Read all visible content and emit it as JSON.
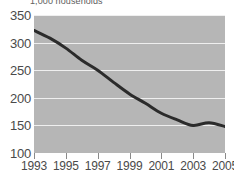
{
  "chart_data": {
    "type": "line",
    "title": "1,000 households",
    "xlabel": "",
    "ylabel": "",
    "x": [
      1993,
      1994,
      1995,
      1996,
      1997,
      1998,
      1999,
      2000,
      2001,
      2002,
      2003,
      2004,
      2005
    ],
    "values": [
      322,
      308,
      290,
      268,
      250,
      228,
      207,
      190,
      172,
      160,
      150,
      155,
      148
    ],
    "series": [
      {
        "name": "households",
        "values": [
          322,
          308,
          290,
          268,
          250,
          228,
          207,
          190,
          172,
          160,
          150,
          155,
          148
        ]
      }
    ],
    "ylim": [
      100,
      350
    ],
    "xlim": [
      1993,
      2005
    ],
    "yticks": [
      100,
      150,
      200,
      250,
      300,
      350
    ],
    "ytick_labels": [
      "100",
      "150",
      "200",
      "250",
      "300",
      "350"
    ],
    "xticks": [
      1993,
      1995,
      1997,
      1999,
      2001,
      2003,
      2005
    ],
    "xtick_labels": [
      "1993",
      "1995",
      "1997",
      "1999",
      "2001",
      "2003",
      "2005"
    ],
    "grid": true,
    "legend": false,
    "legend_position": "none",
    "colors": {
      "plot_background": "#b6b6b6",
      "gridline": "#efefef",
      "line": "#2b2b2b",
      "axis_text": "#4a4a4a",
      "title_text": "#5d5d5d",
      "figure_background": "#ffffff"
    },
    "line_width": 3
  }
}
